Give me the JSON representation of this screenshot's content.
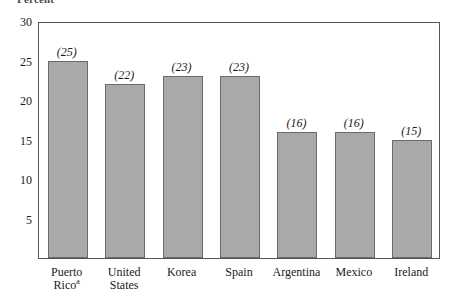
{
  "chart_data": {
    "type": "bar",
    "title": "",
    "ylabel": "Percent",
    "xlabel": "",
    "categories": [
      "Puerto Rico",
      "United States",
      "Korea",
      "Spain",
      "Argentina",
      "Mexico",
      "Ireland"
    ],
    "category_lines": [
      [
        "Puerto",
        "Rico"
      ],
      [
        "United",
        "States"
      ],
      [
        "Korea"
      ],
      [
        "Spain"
      ],
      [
        "Argentina"
      ],
      [
        "Mexico"
      ],
      [
        "Ireland"
      ]
    ],
    "category_footnotes": [
      "a",
      "",
      "",
      "",
      "",
      "",
      ""
    ],
    "values": [
      25,
      22,
      23,
      23,
      16,
      16,
      15
    ],
    "value_labels": [
      "(25)",
      "(22)",
      "(23)",
      "(23)",
      "(16)",
      "(16)",
      "(15)"
    ],
    "ylim": [
      0,
      30
    ],
    "yticks": [
      30,
      25,
      20,
      15,
      10,
      5
    ],
    "ytick_labels": [
      "30",
      "25",
      "20",
      "15",
      "10",
      "5"
    ],
    "grid": false,
    "legend": "none",
    "bar_color": "#a9a9a9",
    "bar_border_color": "#6a6a6a",
    "frame_color": "#555555"
  }
}
